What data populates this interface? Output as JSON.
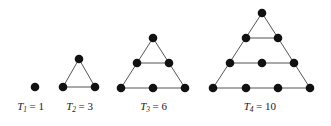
{
  "figure": {
    "background_color": "#ffffff",
    "dot_color": "#111111",
    "edge_color": "#555555",
    "dot_radius": 4.3,
    "width": 331,
    "height": 126
  },
  "chart_data": {
    "type": "scatter",
    "xlabel": "",
    "ylabel": "",
    "grid": false,
    "legend": "none",
    "series": [
      {
        "name": "T1",
        "label_symbol": "T",
        "label_subscript": "1",
        "label_equals": "=",
        "label_value": "1",
        "caption": "T₁ = 1",
        "rows": 1,
        "dot_count": 1,
        "points": [
          {
            "x": 35,
            "y": 87
          }
        ],
        "edges": []
      },
      {
        "name": "T2",
        "label_symbol": "T",
        "label_subscript": "2",
        "label_equals": "=",
        "label_value": "3",
        "caption": "T₂ = 3",
        "rows": 2,
        "dot_count": 3,
        "points": [
          {
            "x": 79,
            "y": 59
          },
          {
            "x": 63,
            "y": 87
          },
          {
            "x": 95,
            "y": 87
          }
        ],
        "edges": [
          {
            "x1": 79,
            "y1": 59,
            "x2": 63,
            "y2": 87
          },
          {
            "x1": 79,
            "y1": 59,
            "x2": 95,
            "y2": 87
          },
          {
            "x1": 63,
            "y1": 87,
            "x2": 95,
            "y2": 87
          }
        ]
      },
      {
        "name": "T3",
        "label_symbol": "T",
        "label_subscript": "3",
        "label_equals": "=",
        "label_value": "6",
        "caption": "T₃ = 6",
        "rows": 3,
        "dot_count": 6,
        "points": [
          {
            "x": 153,
            "y": 38
          },
          {
            "x": 137,
            "y": 63
          },
          {
            "x": 169,
            "y": 63
          },
          {
            "x": 121,
            "y": 88
          },
          {
            "x": 153,
            "y": 88
          },
          {
            "x": 185,
            "y": 88
          }
        ],
        "edges": [
          {
            "x1": 153,
            "y1": 38,
            "x2": 121,
            "y2": 88
          },
          {
            "x1": 153,
            "y1": 38,
            "x2": 185,
            "y2": 88
          },
          {
            "x1": 121,
            "y1": 88,
            "x2": 185,
            "y2": 88
          },
          {
            "x1": 137,
            "y1": 63,
            "x2": 169,
            "y2": 63
          }
        ]
      },
      {
        "name": "T4",
        "label_symbol": "T",
        "label_subscript": "4",
        "label_equals": "=",
        "label_value": "10",
        "caption": "T₄ = 10",
        "rows": 4,
        "dot_count": 10,
        "points": [
          {
            "x": 262,
            "y": 13
          },
          {
            "x": 246,
            "y": 38
          },
          {
            "x": 278,
            "y": 38
          },
          {
            "x": 230,
            "y": 63
          },
          {
            "x": 262,
            "y": 63
          },
          {
            "x": 294,
            "y": 63
          },
          {
            "x": 213,
            "y": 88
          },
          {
            "x": 246,
            "y": 88
          },
          {
            "x": 278,
            "y": 88
          },
          {
            "x": 310,
            "y": 88
          }
        ],
        "edges": [
          {
            "x1": 262,
            "y1": 13,
            "x2": 213,
            "y2": 88
          },
          {
            "x1": 262,
            "y1": 13,
            "x2": 310,
            "y2": 88
          },
          {
            "x1": 213,
            "y1": 88,
            "x2": 310,
            "y2": 88
          },
          {
            "x1": 246,
            "y1": 38,
            "x2": 278,
            "y2": 38
          },
          {
            "x1": 230,
            "y1": 63,
            "x2": 294,
            "y2": 63
          }
        ]
      }
    ],
    "captions": [
      {
        "text": "T",
        "sub": "1",
        "eq": "= 1",
        "cx": 44,
        "cy": 110
      },
      {
        "text": "T",
        "sub": "2",
        "eq": "= 3",
        "cx": 93,
        "cy": 110
      },
      {
        "text": "T",
        "sub": "3",
        "eq": "= 6",
        "cx": 167,
        "cy": 110
      },
      {
        "text": "T",
        "sub": "4",
        "eq": "= 10",
        "cx": 276,
        "cy": 110
      }
    ]
  }
}
